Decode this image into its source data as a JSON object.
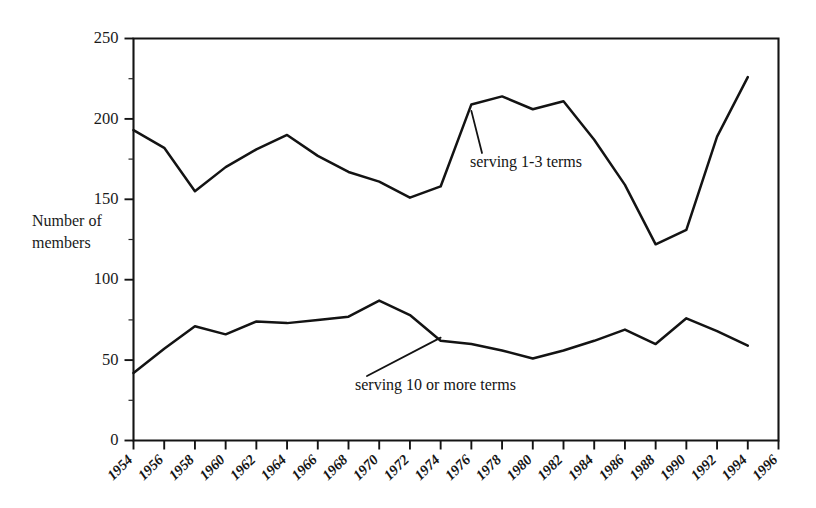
{
  "chart_data": {
    "type": "line",
    "title": "",
    "xlabel": "",
    "ylabel": "Number of members",
    "ylabel_line1": "Number of",
    "ylabel_line2": "members",
    "xlim": [
      1954,
      1996
    ],
    "ylim": [
      0,
      250
    ],
    "grid": false,
    "legend_position": "inline-annotations",
    "y_ticks_major": [
      0,
      50,
      100,
      150,
      200,
      250
    ],
    "y_ticks_minor": [
      25,
      75,
      125,
      175,
      225
    ],
    "y_tick_labels": [
      "0",
      "50",
      "100",
      "150",
      "200",
      "250"
    ],
    "x": [
      1954,
      1956,
      1958,
      1960,
      1962,
      1964,
      1966,
      1968,
      1970,
      1972,
      1974,
      1976,
      1978,
      1980,
      1982,
      1984,
      1986,
      1988,
      1990,
      1992,
      1994,
      1996
    ],
    "x_tick_labels": [
      "1954",
      "1956",
      "1958",
      "1960",
      "1962",
      "1964",
      "1966",
      "1968",
      "1970",
      "1972",
      "1974",
      "1976",
      "1978",
      "1980",
      "1982",
      "1984",
      "1986",
      "1988",
      "1990",
      "1992",
      "1994",
      "1996"
    ],
    "series": [
      {
        "name": "serving 1-3 terms",
        "label": "serving 1-3 terms",
        "color": "#131313",
        "x": [
          1954,
          1956,
          1958,
          1960,
          1962,
          1964,
          1966,
          1968,
          1970,
          1972,
          1974,
          1976,
          1978,
          1980,
          1982,
          1984,
          1986,
          1988,
          1990,
          1992,
          1994
        ],
        "values": [
          193,
          182,
          155,
          170,
          181,
          190,
          177,
          167,
          161,
          151,
          158,
          209,
          214,
          206,
          211,
          187,
          159,
          122,
          131,
          189,
          226
        ]
      },
      {
        "name": "serving 10 or more terms",
        "label": "serving 10 or more terms",
        "color": "#131313",
        "x": [
          1954,
          1956,
          1958,
          1960,
          1962,
          1964,
          1966,
          1968,
          1970,
          1972,
          1974,
          1976,
          1978,
          1980,
          1982,
          1984,
          1986,
          1988,
          1990,
          1992,
          1994
        ],
        "values": [
          42,
          57,
          71,
          66,
          74,
          73,
          75,
          77,
          87,
          78,
          62,
          60,
          56,
          51,
          56,
          62,
          69,
          60,
          76,
          68,
          59
        ]
      }
    ],
    "annotations": [
      {
        "text": "serving 1-3 terms",
        "anchor_year": 1976,
        "anchor_value": 205,
        "text_x": 470,
        "text_y": 167
      },
      {
        "text": "serving 10 or more terms",
        "anchor_year": 1974,
        "anchor_value": 64,
        "text_x": 355,
        "text_y": 390
      }
    ]
  }
}
